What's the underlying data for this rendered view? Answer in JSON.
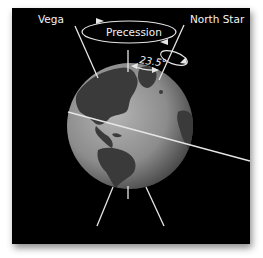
{
  "diagram": {
    "labels": {
      "vega": "Vega",
      "north_star": "North Star",
      "precession": "Precession",
      "tilt": "23.5°"
    },
    "tilt_degrees": 23.5,
    "colors": {
      "background": "#000000",
      "lines": "#e6e6e6",
      "ocean_light": "#a8a8a8",
      "ocean_dark": "#3a3a3a",
      "land": "#3c3c3c"
    }
  }
}
